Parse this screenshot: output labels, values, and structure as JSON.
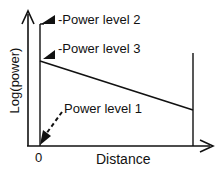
{
  "diagram": {
    "y_axis_label": "Log(power)",
    "x_axis_label": "Distance",
    "origin_label": "0",
    "annotations": [
      {
        "label": "-Power level 2",
        "points_to": "top of initial vertical line"
      },
      {
        "label": "-Power level 3",
        "points_to": "start of sloped line"
      },
      {
        "label": "Power level 1",
        "points_to": "origin (dashed arrow)"
      }
    ],
    "colors": {
      "line": "#111111",
      "background": "#ffffff"
    }
  }
}
